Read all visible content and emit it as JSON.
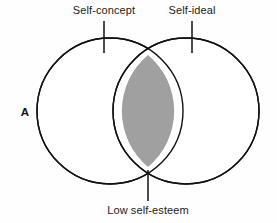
{
  "figure": {
    "name": "self-concept-self-ideal-venn",
    "panel_letter": "A",
    "background_color": "#fefefe",
    "stroke_color": "#111111",
    "overlap_fill": "#a0a0a0",
    "circle_fill": "#ffffff"
  },
  "labels": {
    "left_circle": "Self-concept",
    "right_circle": "Self-ideal",
    "overlap": "Low self-esteem"
  },
  "chart_data": {
    "type": "diagram",
    "subtype": "venn-2-set",
    "title": "",
    "panel": "A",
    "sets": [
      {
        "id": "self-concept",
        "label": "Self-concept",
        "center_x": 110,
        "center_y": 111,
        "radius": 73,
        "fill": "#ffffff",
        "label_x": 104,
        "label_y": 14,
        "leader_x": 104,
        "leader_y_top": 21,
        "leader_y_bottom": 53
      },
      {
        "id": "self-ideal",
        "label": "Self-ideal",
        "center_x": 186,
        "center_y": 111,
        "radius": 73,
        "fill": "#ffffff",
        "label_x": 192,
        "label_y": 14,
        "leader_x": 192,
        "leader_y_top": 21,
        "leader_y_bottom": 53
      }
    ],
    "intersection": {
      "id": "low-self-esteem",
      "label": "Low self-esteem",
      "fill": "#a0a0a0",
      "shaded": true,
      "top_point_x": 148,
      "top_point_y": 55,
      "bottom_point_x": 148,
      "bottom_point_y": 167,
      "label_x": 148,
      "label_y": 214,
      "leader_x": 148,
      "leader_y_top": 170,
      "leader_y_bottom": 201
    },
    "annotations": [
      {
        "text": "A",
        "x": 25,
        "y": 116,
        "bold": true
      }
    ]
  }
}
